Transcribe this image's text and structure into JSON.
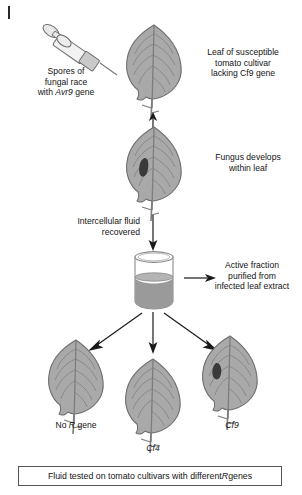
{
  "figure": {
    "title_tick": "|",
    "labels": {
      "spores": {
        "line1": "Spores of",
        "line2": "fungal race",
        "line3_pre": "with ",
        "line3_em": "Avr9",
        "line3_post": " gene"
      },
      "susceptible_leaf": {
        "line1": "Leaf of susceptible",
        "line2": "tomato cultivar",
        "line3": "lacking Cf9 gene"
      },
      "fungus_develops": {
        "line1": "Fungus develops",
        "line2": "within leaf"
      },
      "fluid_recovered": {
        "line1": "Intercellular fluid",
        "line2": "recovered"
      },
      "active_fraction": {
        "line1": "Active fraction",
        "line2": "purified from",
        "line3": "infected leaf extract"
      },
      "cultivar_left": {
        "pre": "No ",
        "em": "R",
        "post": " gene"
      },
      "cultivar_mid": {
        "em": "Cf4"
      },
      "cultivar_right": {
        "em": "Cf9"
      }
    },
    "caption": {
      "pre": "Fluid tested on tomato cultivars with different ",
      "em": "R",
      "post": " genes"
    },
    "colors": {
      "leaf_fill": "#a9a9a9",
      "leaf_stroke": "#6e6e6e",
      "vein": "#7d7d7d",
      "lesion": "#3a3a3a",
      "fluid": "#9a9a9a",
      "glass": "#8a8a8a",
      "arrow": "#1a1a1a",
      "text": "#141414",
      "box_border": "#555555",
      "background": "#ffffff"
    },
    "icons": {
      "syringe": "syringe-icon",
      "leaf": "leaf-icon",
      "beaker": "beaker-icon",
      "arrow": "arrow-icon"
    }
  }
}
